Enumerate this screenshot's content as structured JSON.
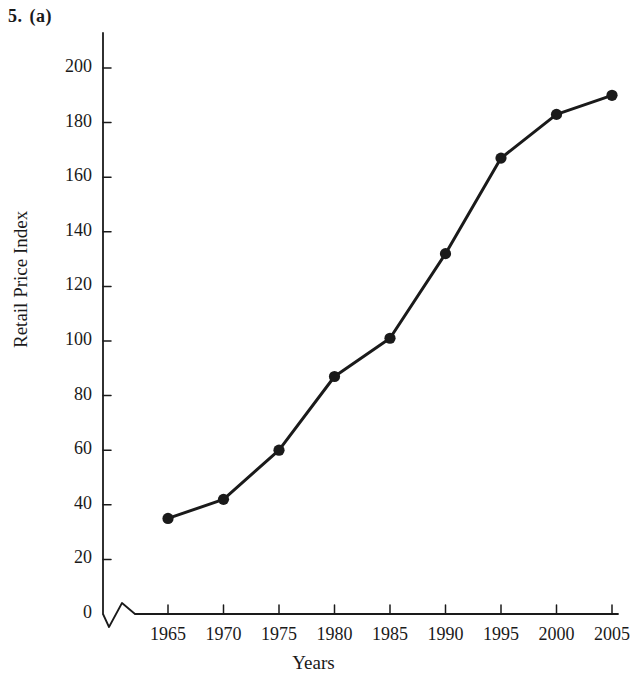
{
  "figure": {
    "number": "5.",
    "part": "(a)"
  },
  "chart_data": {
    "type": "line",
    "title": "",
    "xlabel": "Years",
    "ylabel": "Retail Price Index",
    "x": [
      1965,
      1970,
      1975,
      1980,
      1985,
      1990,
      1995,
      2000,
      2005
    ],
    "categories": [
      "1965",
      "1970",
      "1975",
      "1980",
      "1985",
      "1990",
      "1995",
      "2000",
      "2005"
    ],
    "values": [
      35,
      42,
      60,
      87,
      101,
      132,
      167,
      183,
      190
    ],
    "series": [
      {
        "name": "Retail Price Index",
        "values": [
          35,
          42,
          60,
          87,
          101,
          132,
          167,
          183,
          190
        ]
      }
    ],
    "xlim": [
      1965,
      2005
    ],
    "ylim": [
      0,
      200
    ],
    "yticks": [
      0,
      20,
      40,
      60,
      80,
      100,
      120,
      140,
      160,
      180,
      200
    ],
    "ytick_labels": [
      "0",
      "20",
      "40",
      "60",
      "80",
      "100",
      "120",
      "140",
      "160",
      "180",
      "200"
    ],
    "xticks": [
      1965,
      1970,
      1975,
      1980,
      1985,
      1990,
      1995,
      2000,
      2005
    ],
    "xtick_labels": [
      "1965",
      "1970",
      "1975",
      "1980",
      "1985",
      "1990",
      "1995",
      "2000",
      "2005"
    ],
    "grid": false,
    "legend": false,
    "legend_position": "none",
    "axis_break": true,
    "marker": "filled-circle",
    "line_color": "#1a1a1a",
    "marker_color": "#1a1a1a"
  }
}
